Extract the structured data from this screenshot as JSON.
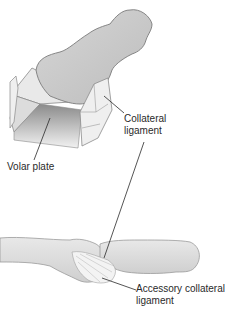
{
  "figure": {
    "labels": {
      "collateral_ligament": [
        "Collateral",
        "ligament"
      ],
      "volar_plate": "Volar plate",
      "accessory_collateral_ligament": [
        "Accessory collateral",
        "ligament"
      ]
    },
    "colors": {
      "bone_fill": "#c9c9c9",
      "bone_stroke": "#7a7a7a",
      "ligament_fill": "#eeeeee",
      "leader_line": "#2a2a2a",
      "text": "#2a2a2a"
    }
  }
}
